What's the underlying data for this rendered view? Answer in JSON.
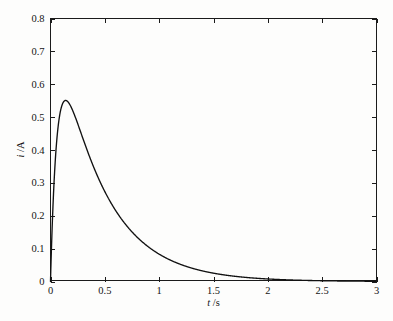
{
  "chart_data": {
    "type": "line",
    "title": "",
    "subtitle": "",
    "xlabel": "t /s",
    "xlabel_symbol": "t",
    "xlabel_unit": "/s",
    "ylabel": "i /A",
    "ylabel_symbol": "i",
    "ylabel_unit": "/A",
    "xlim": [
      0,
      3
    ],
    "ylim": [
      0,
      0.8
    ],
    "grid": false,
    "legend": null,
    "legend_position": "none",
    "box": true,
    "tick_direction": "in",
    "line_color": "#111111",
    "axis_color": "#1b1b1b",
    "background_color": "#fdfdfc",
    "xticks": [
      0,
      0.5,
      1,
      1.5,
      2,
      2.5,
      3
    ],
    "xticklabels": [
      "0",
      "0.5",
      "1",
      "1.5",
      "2",
      "2.5",
      "3"
    ],
    "xminorticks": [
      0.25,
      0.75,
      1.25,
      1.75,
      2.25,
      2.75
    ],
    "yticks": [
      0,
      0.1,
      0.2,
      0.3,
      0.4,
      0.5,
      0.6,
      0.7,
      0.8
    ],
    "yticklabels": [
      "0",
      "0.1",
      "0.2",
      "0.3",
      "0.4",
      "0.5",
      "0.6",
      "0.7",
      "0.8"
    ],
    "peak": {
      "x": 0.21,
      "y": 0.735
    },
    "annotations": [],
    "series": [
      {
        "name": "i(t)",
        "color": "#111111",
        "x": [
          0.0,
          0.01,
          0.02,
          0.03,
          0.04,
          0.05,
          0.06,
          0.07,
          0.08,
          0.09,
          0.1,
          0.11,
          0.12,
          0.13,
          0.14,
          0.15,
          0.16,
          0.17,
          0.18,
          0.19,
          0.2,
          0.21,
          0.22,
          0.23,
          0.24,
          0.25,
          0.26,
          0.28,
          0.3,
          0.32,
          0.34,
          0.36,
          0.38,
          0.4,
          0.43,
          0.46,
          0.5,
          0.54,
          0.58,
          0.62,
          0.66,
          0.7,
          0.75,
          0.8,
          0.85,
          0.9,
          0.95,
          1.0,
          1.05,
          1.1,
          1.15,
          1.2,
          1.3,
          1.4,
          1.5,
          1.6,
          1.7,
          1.8,
          1.9,
          2.0,
          2.2,
          2.4,
          2.6,
          2.8,
          3.0
        ],
        "y": [
          0.0,
          0.151,
          0.27,
          0.363,
          0.436,
          0.492,
          0.535,
          0.567,
          0.591,
          0.608,
          0.62,
          0.629,
          0.634,
          0.637,
          0.638,
          0.637,
          0.636,
          0.634,
          0.631,
          0.628,
          0.625,
          0.621,
          0.617,
          0.613,
          0.609,
          0.604,
          0.6,
          0.59,
          0.58,
          0.57,
          0.56,
          0.549,
          0.539,
          0.529,
          0.513,
          0.498,
          0.477,
          0.457,
          0.437,
          0.418,
          0.399,
          0.382,
          0.36,
          0.339,
          0.319,
          0.3,
          0.282,
          0.265,
          0.249,
          0.234,
          0.22,
          0.207,
          0.182,
          0.161,
          0.141,
          0.124,
          0.109,
          0.096,
          0.085,
          0.074,
          0.057,
          0.044,
          0.034,
          0.026,
          0.02
        ]
      }
    ],
    "model": {
      "form": "A*(exp(-t/tau1) - exp(-t/tau2))",
      "amplitude": 0.9,
      "tau1": 0.42,
      "tau2": 0.062
    }
  },
  "figure": {
    "plot_left_px": 50,
    "plot_top_px": 18,
    "plot_right_px": 377,
    "plot_bottom_px": 281
  }
}
